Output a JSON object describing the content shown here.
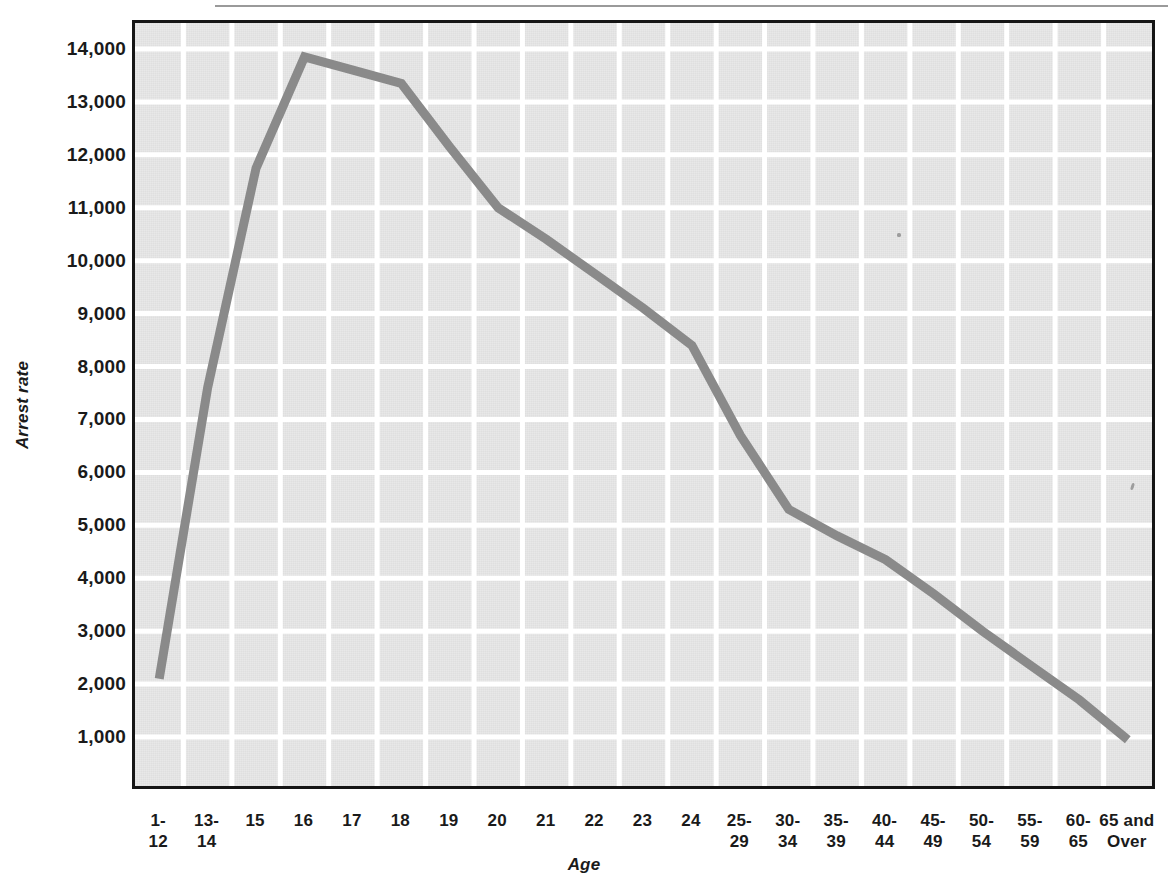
{
  "chart_data": {
    "type": "line",
    "title": "",
    "xlabel": "Age",
    "ylabel": "Arrest rate",
    "categories": [
      "1-\n12",
      "13-\n14",
      "15",
      "16",
      "17",
      "18",
      "19",
      "20",
      "21",
      "22",
      "23",
      "24",
      "25-\n29",
      "30-\n34",
      "35-\n39",
      "40-\n44",
      "45-\n49",
      "50-\n54",
      "55-\n59",
      "60-\n65",
      "65 and\nOver"
    ],
    "values": [
      2100,
      7600,
      11750,
      13850,
      13600,
      13350,
      12150,
      11000,
      10400,
      9750,
      9100,
      8400,
      6700,
      5300,
      4800,
      4350,
      3700,
      3000,
      2350,
      1700,
      950
    ],
    "ytick_labels": [
      "14,000",
      "13,000",
      "12,000",
      "11,000",
      "10,000",
      "9,000",
      "8,000",
      "7,000",
      "6,000",
      "5,000",
      "4,000",
      "3,000",
      "2,000",
      "1,000"
    ],
    "ytick_values": [
      14000,
      13000,
      12000,
      11000,
      10000,
      9000,
      8000,
      7000,
      6000,
      5000,
      4000,
      3000,
      2000,
      1000
    ],
    "ylim": [
      0,
      14600
    ],
    "grid": true,
    "legend": "none",
    "line_color": "#8a8a8a",
    "grid_color": "#ffffff",
    "plot_bg_color": "#e8e8e8",
    "axis_color": "#151515"
  }
}
